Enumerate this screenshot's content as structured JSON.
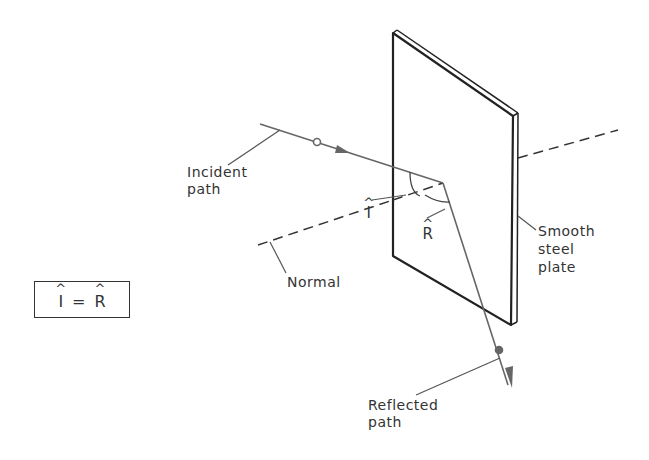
{
  "labels": {
    "incident_path": "Incident\npath",
    "reflected_path": "Reflected\npath",
    "normal": "Normal",
    "plate": "Smooth\nsteel\nplate",
    "angle_incidence": "I",
    "angle_reflection": "R"
  },
  "formula": {
    "left": "I",
    "operator": "=",
    "right": "R"
  },
  "colors": {
    "line": "#333333",
    "ray": "#666666"
  }
}
